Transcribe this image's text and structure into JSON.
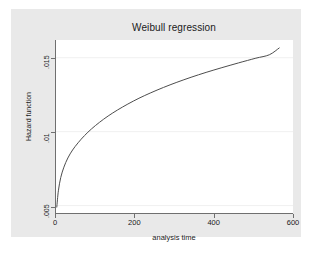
{
  "chart_data": {
    "type": "line",
    "title": "Weibull regression",
    "xlabel": "analysis time",
    "ylabel": "Hazard function",
    "xlim": [
      0,
      600
    ],
    "ylim": [
      0.0045,
      0.0162
    ],
    "xticks": [
      0,
      200,
      400,
      600
    ],
    "xtick_labels": [
      "0",
      "200",
      "400",
      "600"
    ],
    "yticks": [
      0.005,
      0.01,
      0.015
    ],
    "ytick_labels": [
      ".005",
      ".01",
      ".015"
    ],
    "grid": "horizontal-faint",
    "legend": null,
    "series": [
      {
        "name": "Hazard function",
        "color": "#4d4d4d",
        "x": [
          2,
          6,
          12,
          20,
          30,
          42,
          56,
          72,
          90,
          110,
          132,
          156,
          182,
          210,
          240,
          272,
          306,
          342,
          380,
          420,
          462,
          506,
          540,
          565
        ],
        "y": [
          0.0049,
          0.006,
          0.0069,
          0.0076,
          0.00822,
          0.00876,
          0.00925,
          0.00973,
          0.01019,
          0.01063,
          0.01106,
          0.01147,
          0.01187,
          0.01226,
          0.01263,
          0.01299,
          0.01334,
          0.01368,
          0.01401,
          0.01433,
          0.01465,
          0.01497,
          0.0152,
          0.01566
        ]
      }
    ]
  },
  "figure": {
    "title": "Weibull regression",
    "caption_fragment": ""
  }
}
